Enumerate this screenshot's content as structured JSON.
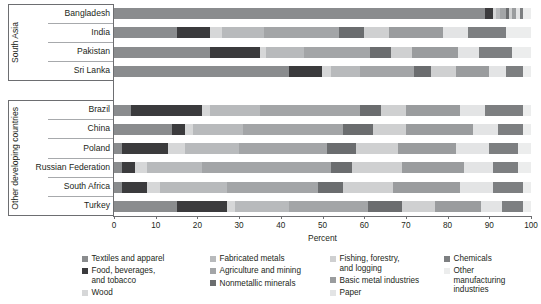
{
  "chart_data": {
    "type": "bar",
    "orientation": "horizontal",
    "stacked": true,
    "title": "",
    "xlabel": "Percent",
    "ylabel": "",
    "xlim": [
      0,
      100
    ],
    "xticks": [
      0,
      10,
      20,
      30,
      40,
      50,
      60,
      70,
      80,
      90,
      100
    ],
    "grid": false,
    "legend_position": "bottom",
    "groups": [
      {
        "name": "South Asia",
        "categories": [
          "Bangladesh",
          "India",
          "Pakistan",
          "Sri Lanka"
        ]
      },
      {
        "name": "Other developing countries",
        "categories": [
          "Brazil",
          "China",
          "Poland",
          "Russian Federation",
          "South Africa",
          "Turkey"
        ]
      }
    ],
    "categories": [
      "Bangladesh",
      "India",
      "Pakistan",
      "Sri Lanka",
      "Brazil",
      "China",
      "Poland",
      "Russian Federation",
      "South Africa",
      "Turkey"
    ],
    "series": [
      {
        "name": "Textiles and apparel",
        "color": "#8a8c8e",
        "values": [
          89.0,
          15.0,
          23.0,
          42.0,
          4.0,
          14.0,
          2.0,
          2.0,
          2.0,
          15.0
        ]
      },
      {
        "name": "Food, beverages, and tobacco",
        "color": "#3b3b3d",
        "values": [
          2.0,
          8.0,
          12.0,
          8.0,
          17.0,
          3.0,
          11.0,
          3.0,
          6.0,
          12.0
        ]
      },
      {
        "name": "Wood",
        "color": "#d6d7d8",
        "values": [
          0.5,
          3.0,
          1.5,
          2.0,
          2.0,
          2.0,
          4.0,
          3.0,
          3.0,
          2.0
        ]
      },
      {
        "name": "Fabricated metals",
        "color": "#b8babc",
        "values": [
          1.0,
          10.0,
          9.0,
          7.0,
          12.0,
          12.0,
          13.0,
          13.0,
          16.0,
          13.0
        ]
      },
      {
        "name": "Agriculture and mining",
        "color": "#a3a5a7",
        "values": [
          1.5,
          18.0,
          16.0,
          13.0,
          24.0,
          24.0,
          21.0,
          31.0,
          22.0,
          19.0
        ]
      },
      {
        "name": "Nonmetallic minerals",
        "color": "#6b6d6f",
        "values": [
          0.8,
          6.0,
          5.0,
          4.0,
          5.0,
          7.0,
          7.0,
          5.0,
          6.0,
          8.0
        ]
      },
      {
        "name": "Fishing, forestry, and logging",
        "color": "#cfd0d1",
        "values": [
          0.7,
          6.0,
          5.0,
          6.0,
          6.0,
          8.0,
          10.0,
          12.0,
          12.0,
          8.0
        ]
      },
      {
        "name": "Basic metal industries",
        "color": "#9a9c9e",
        "values": [
          1.0,
          13.0,
          11.0,
          8.0,
          13.0,
          16.0,
          14.0,
          15.0,
          16.0,
          11.0
        ]
      },
      {
        "name": "Paper",
        "color": "#e3e4e5",
        "values": [
          0.8,
          6.0,
          5.0,
          4.0,
          6.0,
          6.0,
          8.0,
          7.0,
          8.0,
          5.0
        ]
      },
      {
        "name": "Chemicals",
        "color": "#7d7f81",
        "values": [
          0.9,
          9.0,
          8.0,
          4.0,
          9.0,
          6.0,
          7.0,
          6.0,
          7.0,
          5.0
        ]
      },
      {
        "name": "Other manufacturing industries",
        "color": "#eceded",
        "values": [
          1.8,
          6.0,
          4.5,
          2.0,
          2.0,
          2.0,
          3.0,
          3.0,
          2.0,
          2.0
        ]
      }
    ]
  },
  "axis": {
    "x_title": "Percent",
    "tick_labels": [
      "0",
      "10",
      "20",
      "30",
      "40",
      "50",
      "60",
      "70",
      "80",
      "90",
      "100"
    ]
  },
  "group_labels": {
    "south_asia": "South Asia",
    "other": "Other developing countries"
  },
  "category_labels": {
    "bangladesh": "Bangladesh",
    "india": "India",
    "pakistan": "Pakistan",
    "sri_lanka": "Sri Lanka",
    "brazil": "Brazil",
    "china": "China",
    "poland": "Poland",
    "russian_federation": "Russian Federation",
    "south_africa": "South Africa",
    "turkey": "Turkey"
  },
  "legend": {
    "columns": [
      [
        {
          "label": "Textiles and apparel",
          "color": "#8a8c8e"
        },
        {
          "label": "Food, beverages, and tobacco",
          "color": "#3b3b3d"
        },
        {
          "label": "Wood",
          "color": "#d6d7d8"
        }
      ],
      [
        {
          "label": "Fabricated metals",
          "color": "#b8babc"
        },
        {
          "label": "Agriculture and mining",
          "color": "#a3a5a7"
        },
        {
          "label": "Nonmetallic minerals",
          "color": "#6b6d6f"
        }
      ],
      [
        {
          "label": "Fishing, forestry, and logging",
          "color": "#cfd0d1"
        },
        {
          "label": "Basic metal industries",
          "color": "#9a9c9e"
        },
        {
          "label": "Paper",
          "color": "#e3e4e5"
        }
      ],
      [
        {
          "label": "Chemicals",
          "color": "#7d7f81"
        },
        {
          "label": "Other manufacturing industries",
          "color": "#eceded"
        }
      ]
    ]
  }
}
